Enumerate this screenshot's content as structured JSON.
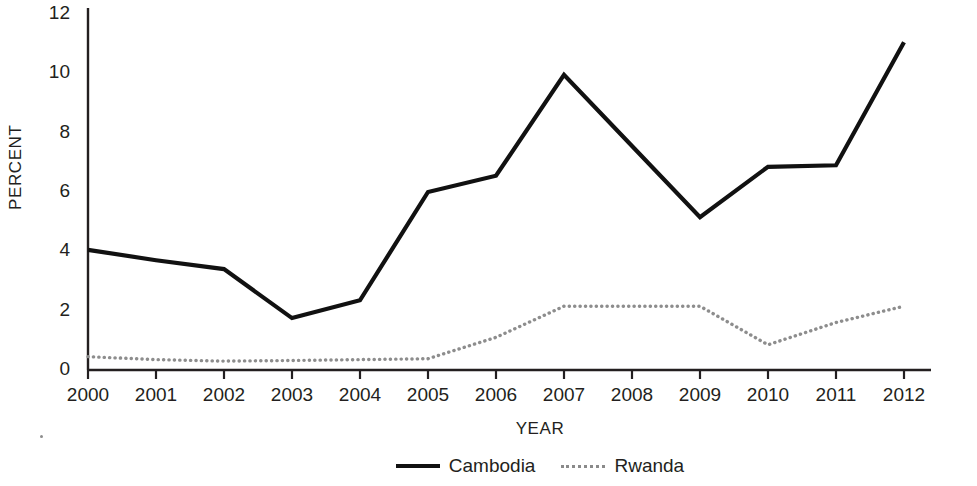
{
  "chart_data": {
    "type": "line",
    "title": "",
    "xlabel": "YEAR",
    "ylabel": "PERCENT",
    "x": [
      2000,
      2001,
      2002,
      2003,
      2004,
      2005,
      2006,
      2007,
      2008,
      2009,
      2010,
      2011,
      2012
    ],
    "categories": [
      "2000",
      "2001",
      "2002",
      "2003",
      "2004",
      "2005",
      "2006",
      "2007",
      "2008",
      "2009",
      "2010",
      "2011",
      "2012"
    ],
    "series": [
      {
        "name": "Cambodia",
        "style": "solid",
        "color": "#111111",
        "values": [
          4.05,
          3.7,
          3.4,
          1.75,
          2.35,
          6.0,
          6.55,
          9.95,
          7.55,
          5.15,
          6.85,
          6.9,
          11.05
        ]
      },
      {
        "name": "Rwanda",
        "style": "dotted",
        "color": "#8d8d8d",
        "values": [
          0.45,
          0.35,
          0.3,
          0.32,
          0.35,
          0.38,
          1.1,
          2.15,
          2.15,
          2.15,
          0.85,
          1.6,
          2.15
        ]
      }
    ],
    "ylim": [
      0,
      12
    ],
    "yticks": [
      0,
      2,
      4,
      6,
      8,
      10,
      12
    ],
    "ytick_labels": [
      "0",
      "2",
      "4",
      "6",
      "8",
      "10",
      "12"
    ],
    "xlim": [
      2000,
      2012
    ],
    "grid": false,
    "legend_position": "bottom-center"
  },
  "legend": {
    "entries": [
      {
        "label": "Cambodia"
      },
      {
        "label": "Rwanda"
      }
    ]
  },
  "axes": {
    "y_title": "PERCENT",
    "x_title": "YEAR"
  }
}
